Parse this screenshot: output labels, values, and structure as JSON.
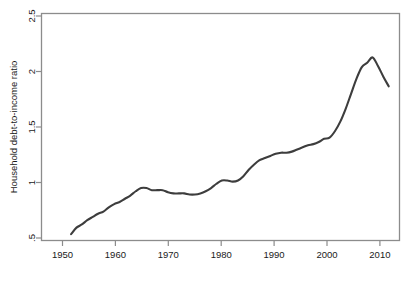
{
  "figure": {
    "background_color": "#ffffff",
    "line_color": "#3d3d3d",
    "frame_color": "#8c8c8c",
    "text_color": "#1a1a1a"
  },
  "caption": {
    "text": "",
    "visible": false
  },
  "chart_data": {
    "type": "line",
    "title": "",
    "xlabel": "",
    "ylabel": "Household debt-to-income ratio",
    "xlim": [
      1946.5,
      2013.0
    ],
    "ylim": [
      0.43,
      2.55
    ],
    "grid": false,
    "legend": null,
    "xticks": [
      1950,
      1960,
      1970,
      1980,
      1990,
      2000,
      2010
    ],
    "xtick_labels": [
      "1950",
      "1960",
      "1970",
      "1980",
      "1990",
      "2000",
      "2010"
    ],
    "yticks": [
      0.5,
      1,
      1.5,
      2,
      2.5
    ],
    "ytick_labels": [
      ".5",
      "1",
      "1.5",
      "2",
      "2.5"
    ],
    "series": [
      {
        "name": "Household debt-to-income ratio",
        "x": [
          1952,
          1953,
          1954,
          1955,
          1956,
          1957,
          1958,
          1959,
          1960,
          1961,
          1962,
          1963,
          1964,
          1965,
          1966,
          1967,
          1968,
          1969,
          1970,
          1971,
          1972,
          1973,
          1974,
          1975,
          1976,
          1977,
          1978,
          1979,
          1980,
          1981,
          1982,
          1983,
          1984,
          1985,
          1986,
          1987,
          1988,
          1989,
          1990,
          1991,
          1992,
          1993,
          1994,
          1995,
          1996,
          1997,
          1998,
          1999,
          2000,
          2001,
          2002,
          2003,
          2004,
          2005,
          2006,
          2007,
          2008,
          2009,
          2010,
          2011
        ],
        "values": [
          0.49,
          0.55,
          0.58,
          0.62,
          0.65,
          0.68,
          0.7,
          0.74,
          0.77,
          0.79,
          0.82,
          0.85,
          0.89,
          0.92,
          0.92,
          0.9,
          0.9,
          0.9,
          0.88,
          0.87,
          0.87,
          0.87,
          0.86,
          0.86,
          0.87,
          0.89,
          0.92,
          0.96,
          0.99,
          0.99,
          0.98,
          0.99,
          1.03,
          1.09,
          1.14,
          1.18,
          1.2,
          1.22,
          1.24,
          1.25,
          1.25,
          1.26,
          1.28,
          1.3,
          1.32,
          1.33,
          1.35,
          1.38,
          1.39,
          1.45,
          1.54,
          1.66,
          1.8,
          1.94,
          2.05,
          2.09,
          2.14,
          2.06,
          1.96,
          1.87
        ]
      }
    ]
  }
}
